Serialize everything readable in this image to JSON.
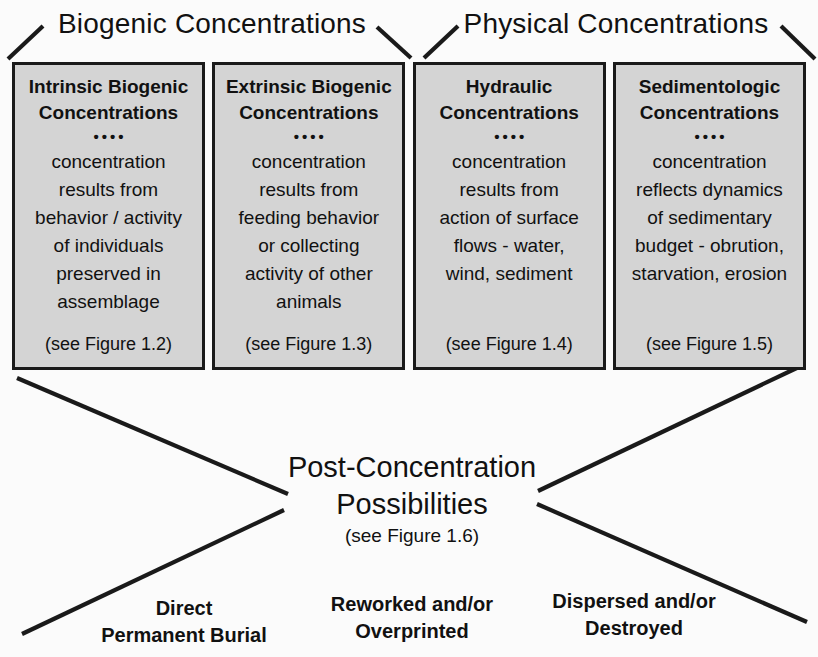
{
  "colors": {
    "background": "#fbfbfb",
    "box_fill": "#d4d4d4",
    "line": "#1a1a1a",
    "text": "#111111"
  },
  "group_headers": [
    {
      "label": "Biogenic Concentrations"
    },
    {
      "label": "Physical Concentrations"
    }
  ],
  "boxes": [
    {
      "title": "Intrinsic Biogenic\nConcentrations",
      "dots": "••••",
      "body": "concentration\nresults from\nbehavior / activity\nof individuals\npreserved in\nassemblage",
      "figure_ref": "(see Figure 1.2)"
    },
    {
      "title": "Extrinsic Biogenic\nConcentrations",
      "dots": "••••",
      "body": "concentration\nresults from\nfeeding behavior\nor collecting\nactivity of other\nanimals",
      "figure_ref": "(see Figure 1.3)"
    },
    {
      "title": "Hydraulic\nConcentrations",
      "dots": "••••",
      "body": "concentration\nresults from\naction of surface\nflows - water,\nwind, sediment",
      "figure_ref": "(see Figure 1.4)"
    },
    {
      "title": "Sedimentologic\nConcentrations",
      "dots": "••••",
      "body": "concentration\nreflects dynamics\nof sedimentary\nbudget - obrution,\nstarvation, erosion",
      "figure_ref": "(see Figure 1.5)"
    }
  ],
  "post_concentration": {
    "title": "Post-Concentration\nPossibilities",
    "figure_ref": "(see Figure 1.6)"
  },
  "outcomes": [
    {
      "label": "Direct\nPermanent Burial"
    },
    {
      "label": "Reworked and/or\nOverprinted"
    },
    {
      "label": "Dispersed and/or\nDestroyed"
    }
  ]
}
